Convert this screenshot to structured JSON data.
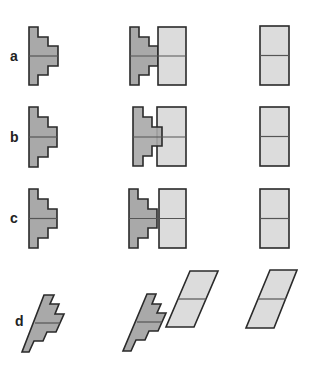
{
  "figure": {
    "type": "diagram",
    "colors": {
      "dark_fill": "#a9a9a9",
      "light_fill": "#dcdcdc",
      "stroke": "#2a2a2a",
      "background": "#ffffff"
    },
    "rows": [
      {
        "label": "a",
        "columns": [
          "stepped-shape",
          "stepped-shape-abutting-rectangle",
          "rectangle"
        ]
      },
      {
        "label": "b",
        "columns": [
          "stepped-shape",
          "stepped-shape-overlapping-rectangle",
          "rectangle"
        ]
      },
      {
        "label": "c",
        "columns": [
          "stepped-shape",
          "stepped-shape-abutting-rectangle",
          "rectangle"
        ]
      },
      {
        "label": "d",
        "columns": [
          "skewed-stepped-shape",
          "skewed-stepped-shape-beside-parallelogram",
          "parallelogram"
        ]
      }
    ]
  }
}
